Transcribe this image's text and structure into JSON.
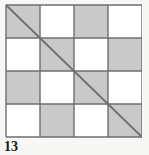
{
  "figure": {
    "caption": "13",
    "kind": "geometric-figure"
  },
  "colors": {
    "background": "#f7f7f5",
    "cell_shaded": "#c9c9c9",
    "cell_empty": "#ffffff",
    "grid_line": "#6e6e6e",
    "diagonal_line": "#6e6e6e",
    "caption_text": "#1a1a1a"
  },
  "grid": {
    "rows": 4,
    "columns": 4,
    "cell_width": 34,
    "cell_height": 33,
    "origin_x": 1,
    "origin_y": 1,
    "line_width": 1.4,
    "pattern_note": "shaded when (row + column) is even",
    "cells": [
      [
        {
          "row": 0,
          "col": 0,
          "fill": "shaded"
        },
        {
          "row": 0,
          "col": 1,
          "fill": "empty"
        },
        {
          "row": 0,
          "col": 2,
          "fill": "shaded"
        },
        {
          "row": 0,
          "col": 3,
          "fill": "empty"
        }
      ],
      [
        {
          "row": 1,
          "col": 0,
          "fill": "empty"
        },
        {
          "row": 1,
          "col": 1,
          "fill": "shaded"
        },
        {
          "row": 1,
          "col": 2,
          "fill": "empty"
        },
        {
          "row": 1,
          "col": 3,
          "fill": "shaded"
        }
      ],
      [
        {
          "row": 2,
          "col": 0,
          "fill": "shaded"
        },
        {
          "row": 2,
          "col": 1,
          "fill": "empty"
        },
        {
          "row": 2,
          "col": 2,
          "fill": "shaded"
        },
        {
          "row": 2,
          "col": 3,
          "fill": "empty"
        }
      ],
      [
        {
          "row": 3,
          "col": 0,
          "fill": "empty"
        },
        {
          "row": 3,
          "col": 1,
          "fill": "shaded"
        },
        {
          "row": 3,
          "col": 2,
          "fill": "empty"
        },
        {
          "row": 3,
          "col": 3,
          "fill": "shaded"
        }
      ]
    ]
  },
  "diagonal": {
    "from": "top-left",
    "to": "bottom-right",
    "x1": 1,
    "y1": 1,
    "x2": 137,
    "y2": 133,
    "width": 1.8
  }
}
